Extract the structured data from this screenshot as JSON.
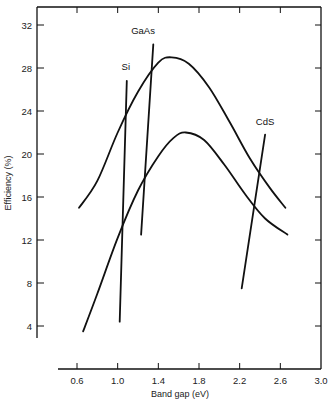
{
  "chart_data": {
    "type": "line",
    "title": "",
    "xlabel": "Band gap (eV)",
    "ylabel": "Efficiency (%)",
    "xlim": [
      0.6,
      3.0
    ],
    "ylim": [
      4,
      32
    ],
    "xticks": [
      "0.6",
      "1.0",
      "1.4",
      "1.8",
      "2.2",
      "2.6",
      "3.0"
    ],
    "yticks": [
      "4",
      "8",
      "12",
      "16",
      "20",
      "24",
      "28",
      "32"
    ],
    "grid": false,
    "legend": "none (inline labels)",
    "series": [
      {
        "name": "upper efficiency curve",
        "kind": "curve",
        "x": [
          0.62,
          0.8,
          1.0,
          1.2,
          1.4,
          1.53,
          1.7,
          1.9,
          2.1,
          2.3,
          2.5,
          2.65
        ],
        "y": [
          15.0,
          17.5,
          22.0,
          25.8,
          28.5,
          29.0,
          28.4,
          26.2,
          23.0,
          19.6,
          16.8,
          15.0
        ]
      },
      {
        "name": "lower efficiency curve",
        "kind": "curve",
        "x": [
          0.66,
          0.8,
          1.0,
          1.2,
          1.4,
          1.55,
          1.67,
          1.85,
          2.05,
          2.25,
          2.45,
          2.67
        ],
        "y": [
          3.5,
          7.0,
          12.2,
          16.6,
          19.8,
          21.5,
          22.0,
          21.3,
          19.0,
          16.3,
          14.0,
          12.5
        ]
      },
      {
        "name": "Si",
        "kind": "material-line",
        "x": [
          1.02,
          1.09
        ],
        "y": [
          4.4,
          26.8
        ],
        "label": "Si",
        "label_pos": [
          1.08,
          27.8
        ]
      },
      {
        "name": "GaAs",
        "kind": "material-line",
        "x": [
          1.23,
          1.35
        ],
        "y": [
          12.5,
          30.2
        ],
        "label": "GaAs",
        "label_pos": [
          1.25,
          31.2
        ]
      },
      {
        "name": "CdS",
        "kind": "material-line",
        "x": [
          2.22,
          2.45
        ],
        "y": [
          7.5,
          21.8
        ],
        "label": "CdS",
        "label_pos": [
          2.45,
          22.7
        ]
      }
    ]
  }
}
